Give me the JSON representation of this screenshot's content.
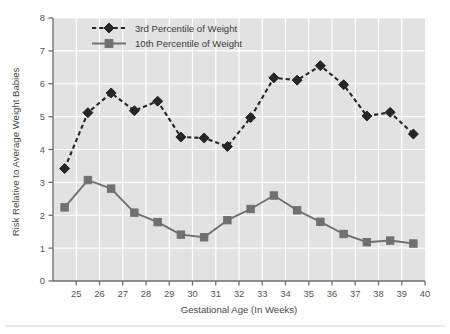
{
  "chart_data": {
    "type": "line",
    "title": "",
    "xlabel": "Gestational Age (In Weeks)",
    "ylabel": "Risk Relative to Average Weight Babies",
    "x": [
      24.5,
      25.5,
      26.5,
      27.5,
      28.5,
      29.5,
      30.5,
      31.5,
      32.5,
      33.5,
      34.5,
      35.5,
      36.5,
      37.5,
      38.5,
      39.5
    ],
    "xlim": [
      24,
      40
    ],
    "ylim": [
      0,
      8
    ],
    "xticks": [
      25,
      26,
      27,
      28,
      29,
      30,
      31,
      32,
      33,
      34,
      35,
      36,
      37,
      38,
      39,
      40
    ],
    "yticks": [
      0,
      1,
      2,
      3,
      4,
      5,
      6,
      7,
      8
    ],
    "grid": true,
    "legend_position": "top-left-inside",
    "series": [
      {
        "name": "3rd Percentile of Weight",
        "values": [
          3.42,
          5.12,
          5.72,
          5.18,
          5.47,
          4.38,
          4.35,
          4.09,
          4.97,
          6.18,
          6.11,
          6.55,
          5.97,
          5.02,
          5.13,
          4.47
        ],
        "color": "#262626",
        "marker": "diamond",
        "linestyle": "dashed"
      },
      {
        "name": "10th Percentile of Weight",
        "values": [
          2.24,
          3.07,
          2.81,
          2.08,
          1.79,
          1.41,
          1.33,
          1.85,
          2.19,
          2.6,
          2.15,
          1.8,
          1.43,
          1.18,
          1.23,
          1.14
        ],
        "color": "#707070",
        "marker": "square",
        "linestyle": "solid"
      }
    ]
  },
  "style": {
    "plot_background": "#e2e2e2",
    "grid_color": "#ffffff",
    "axis_color": "#6e6e6e",
    "page_background": "#ffffff"
  }
}
